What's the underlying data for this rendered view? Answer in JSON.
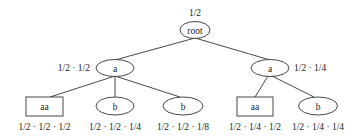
{
  "diagram": {
    "type": "probability-tree",
    "nodes": [
      {
        "id": "root",
        "label": "root",
        "shape": "ellipse",
        "probability": "1/2"
      },
      {
        "id": "a1",
        "label": "a",
        "shape": "ellipse",
        "probability": "1/2 · 1/2",
        "parent": "root"
      },
      {
        "id": "a2",
        "label": "a",
        "shape": "ellipse",
        "probability": "1/2 · 1/4",
        "parent": "root"
      },
      {
        "id": "aa1",
        "label": "aa",
        "shape": "rect",
        "probability": "1/2 · 1/2 · 1/2",
        "parent": "a1"
      },
      {
        "id": "b1",
        "label": "b",
        "shape": "ellipse",
        "probability": "1/2 · 1/2 · 1/4",
        "parent": "a1"
      },
      {
        "id": "b2",
        "label": "b",
        "shape": "ellipse",
        "probability": "1/2 · 1/2 · 1/8",
        "parent": "a1"
      },
      {
        "id": "aa2",
        "label": "aa",
        "shape": "rect",
        "probability": "1/2 · 1/4 · 1/2",
        "parent": "a2"
      },
      {
        "id": "b3",
        "label": "b",
        "shape": "ellipse",
        "probability": "1/2 · 1/4 · 1/4",
        "parent": "a2"
      }
    ]
  }
}
